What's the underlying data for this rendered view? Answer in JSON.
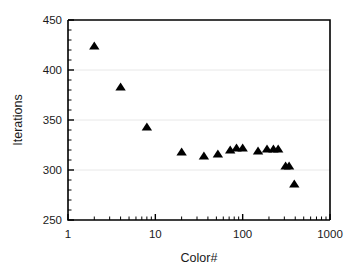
{
  "chart_data": {
    "type": "scatter",
    "title": "",
    "xlabel": "Color#",
    "ylabel": "Iterations",
    "xscale": "log",
    "yscale": "linear",
    "xlim": [
      1,
      1000
    ],
    "ylim": [
      250,
      450
    ],
    "grid": true,
    "grid_axis": "y",
    "legend": "none",
    "marker": "triangle",
    "marker_color": "#000000",
    "x_ticks": [
      1,
      10,
      100,
      1000
    ],
    "x_tick_labels": [
      "1",
      "10",
      "100",
      "1000"
    ],
    "y_ticks": [
      250,
      300,
      350,
      400,
      450
    ],
    "y_tick_labels": [
      "250",
      "300",
      "350",
      "400",
      "450"
    ],
    "y_minor_tick_step": 10,
    "series": [
      {
        "name": "iterations",
        "points": [
          {
            "x": 2,
            "y": 424
          },
          {
            "x": 4,
            "y": 383
          },
          {
            "x": 8,
            "y": 343
          },
          {
            "x": 20,
            "y": 318
          },
          {
            "x": 36,
            "y": 314
          },
          {
            "x": 52,
            "y": 316
          },
          {
            "x": 72,
            "y": 320
          },
          {
            "x": 85,
            "y": 322
          },
          {
            "x": 100,
            "y": 322
          },
          {
            "x": 150,
            "y": 319
          },
          {
            "x": 190,
            "y": 321
          },
          {
            "x": 225,
            "y": 321
          },
          {
            "x": 255,
            "y": 321
          },
          {
            "x": 310,
            "y": 304
          },
          {
            "x": 340,
            "y": 304
          },
          {
            "x": 390,
            "y": 286
          }
        ]
      }
    ]
  },
  "axes": {
    "x_title": "Color#",
    "y_title": "Iterations"
  },
  "colors": {
    "marker": "#000000",
    "axis": "#000000",
    "grid": "#e8e8e8",
    "background": "#ffffff"
  }
}
